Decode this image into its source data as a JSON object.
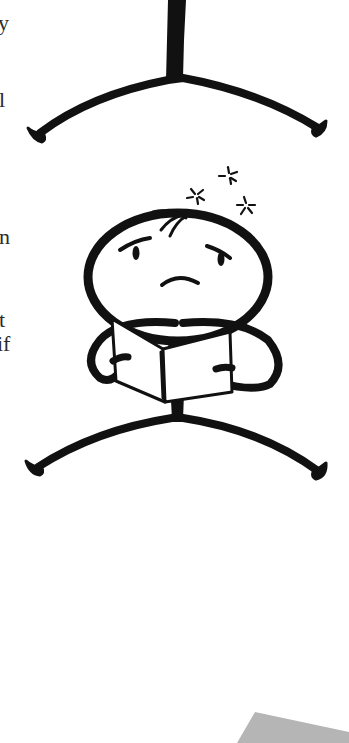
{
  "page": {
    "text_fragments": [
      {
        "text": "y",
        "x": -2,
        "y": 12
      },
      {
        "text": "l",
        "x": -1,
        "y": 89
      },
      {
        "text": "n",
        "x": -1,
        "y": 226
      },
      {
        "text": "t",
        "x": -1,
        "y": 309
      },
      {
        "text": "if",
        "x": -3,
        "y": 333
      }
    ],
    "illustrations": [
      {
        "name": "standing-stick-figure-legs",
        "description": "stick figure torso and bowed legs (upper figure, cropped)"
      },
      {
        "name": "confused-reading-stick-figure",
        "description": "worried stick figure holding an open book with dizzy stars above head"
      }
    ],
    "colors": {
      "ink": "#111111",
      "paper": "#ffffff",
      "text": "#2b2b2b",
      "gray_shape": "#b5b5b5"
    }
  }
}
